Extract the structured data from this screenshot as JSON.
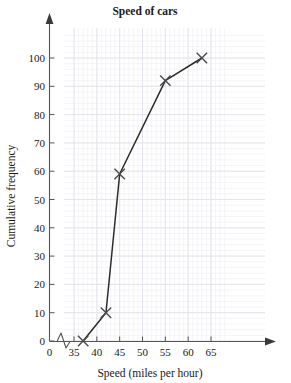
{
  "chart_data": {
    "type": "line",
    "title": "Speed of cars",
    "xlabel": "Speed (miles per hour)",
    "ylabel": "Cumulative frequency",
    "x": [
      37,
      42,
      45,
      55,
      63
    ],
    "values": [
      0,
      10,
      59,
      92,
      100
    ],
    "points": [
      {
        "x": 37,
        "y": 0
      },
      {
        "x": 42,
        "y": 10
      },
      {
        "x": 45,
        "y": 59
      },
      {
        "x": 55,
        "y": 92
      },
      {
        "x": 63,
        "y": 100
      }
    ],
    "xlim": [
      35,
      68
    ],
    "ylim": [
      0,
      108
    ],
    "x_ticks": [
      35,
      40,
      45,
      50,
      55,
      60,
      65
    ],
    "x_tick_labels": [
      "35",
      "40",
      "45",
      "50",
      "55",
      "60",
      "65"
    ],
    "x_origin_label": "0",
    "y_ticks": [
      0,
      10,
      20,
      30,
      40,
      50,
      60,
      70,
      80,
      90,
      100
    ],
    "y_tick_labels": [
      "0",
      "10",
      "20",
      "30",
      "40",
      "50",
      "60",
      "70",
      "80",
      "90",
      "100"
    ],
    "grid": true,
    "grid_major_step_x": 5,
    "grid_minor_step_x": 1,
    "grid_major_step_y": 10,
    "grid_minor_step_y": 2,
    "axis_break_x": true,
    "legend": null,
    "marker": "x-cross",
    "colors": {
      "line": "#2b2b2b",
      "marker": "#4a4a4a",
      "axis": "#555555",
      "grid_major": "#e2e2ea",
      "grid_minor": "#f1f1f6",
      "text": "#1a1a1a",
      "background": "#ffffff"
    }
  }
}
